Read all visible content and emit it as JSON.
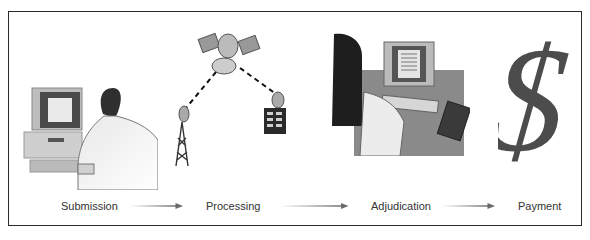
{
  "diagram": {
    "type": "process-flow",
    "steps": [
      {
        "label": "Submission",
        "illustration": "person-at-desktop-computer"
      },
      {
        "label": "Processing",
        "illustration": "satellite-transmission-tower-building"
      },
      {
        "label": "Adjudication",
        "illustration": "person-reviewing-document-on-computer"
      },
      {
        "label": "Payment",
        "illustration": "dollar-sign"
      }
    ],
    "connectors": [
      "arrow",
      "arrow",
      "arrow"
    ],
    "colors": {
      "border": "#2a2a2a",
      "text": "#333333",
      "arrow": "#707070",
      "illustration": "#555555"
    }
  }
}
